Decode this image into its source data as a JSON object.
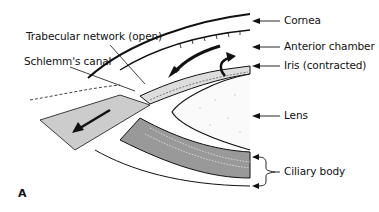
{
  "figure": {
    "panel_letter": "A",
    "labels": {
      "trabecular": "Trabecular network (open)",
      "schlemm": "Schlemm's canal",
      "cornea": "Cornea",
      "anterior_chamber": "Anterior chamber",
      "iris": "Iris (contracted)",
      "lens": "Lens",
      "ciliary_body": "Ciliary body"
    },
    "colors": {
      "ink": "#111111",
      "background": "#ffffff"
    }
  }
}
